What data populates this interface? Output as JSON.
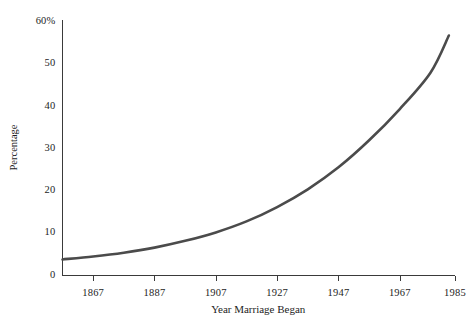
{
  "chart_data": {
    "type": "line",
    "title": "",
    "xlabel": "Year Marriage Began",
    "ylabel": "Percentage",
    "xlim": [
      1857,
      1985
    ],
    "ylim": [
      0,
      60
    ],
    "grid": false,
    "legend": null,
    "x_ticks": [
      1867,
      1887,
      1907,
      1927,
      1947,
      1967,
      1985
    ],
    "x_tick_labels": [
      "1867",
      "1887",
      "1907",
      "1927",
      "1947",
      "1967",
      "1985"
    ],
    "y_ticks": [
      0,
      10,
      20,
      30,
      40,
      50,
      60
    ],
    "y_tick_labels": [
      "0",
      "10",
      "20",
      "30",
      "40",
      "50",
      "60%"
    ],
    "series": [
      {
        "name": "Percentage",
        "color": "#4b4b4b",
        "x": [
          1857,
          1867,
          1877,
          1887,
          1897,
          1907,
          1917,
          1927,
          1937,
          1947,
          1957,
          1967,
          1977,
          1983
        ],
        "values": [
          3.8,
          4.5,
          5.4,
          6.6,
          8.2,
          10.2,
          12.8,
          16.2,
          20.4,
          25.6,
          32.0,
          39.4,
          48.0,
          56.8
        ]
      }
    ]
  },
  "axis": {
    "x_title": "Year Marriage Began",
    "y_title": "Percentage"
  }
}
